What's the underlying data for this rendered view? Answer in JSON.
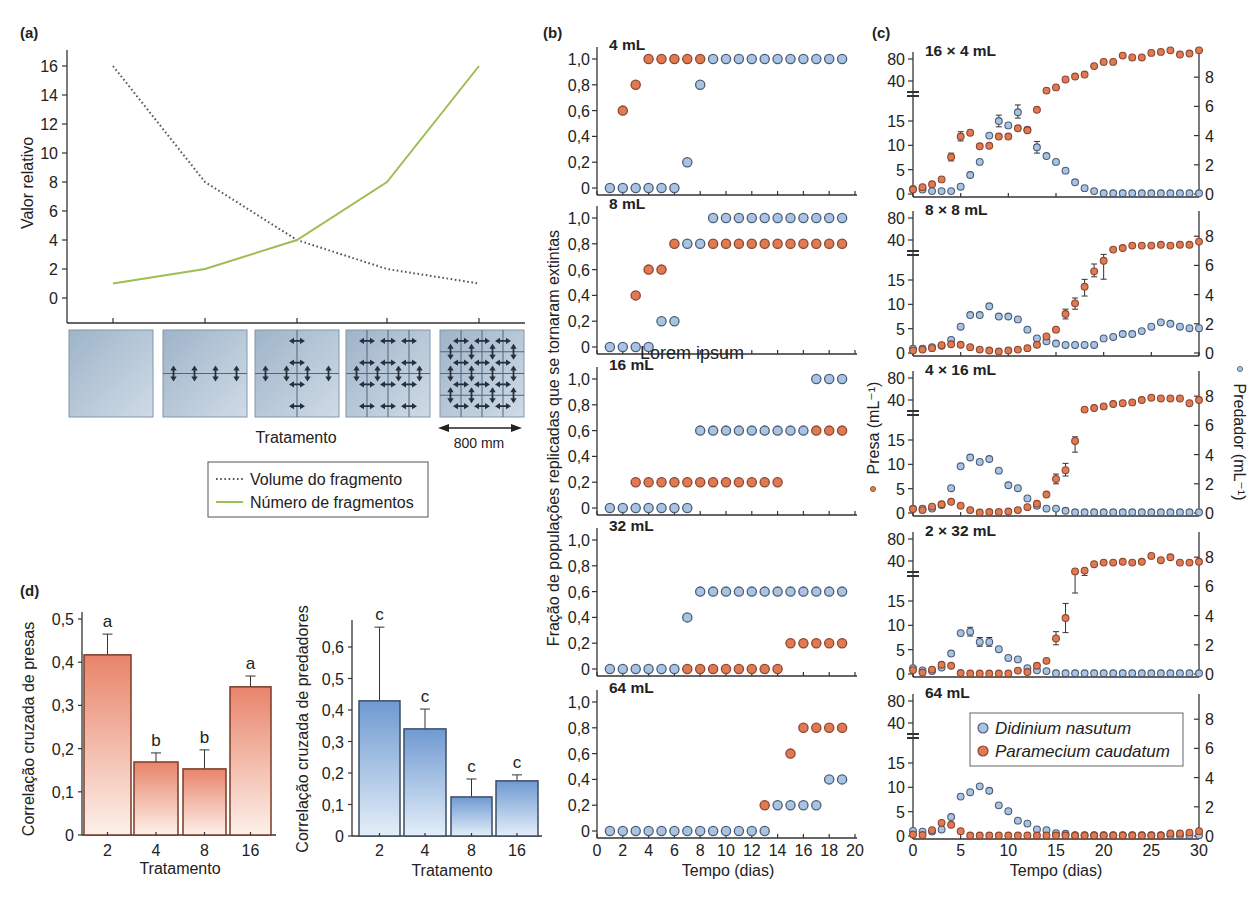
{
  "figure": {
    "overlay_text": "Lorem ipsum"
  },
  "colors": {
    "didinium": "#a9c3e3",
    "didinium_stroke": "#4b5d75",
    "paramecium": "#e07a52",
    "paramecium_stroke": "#8c4630",
    "volume_line": "#555555",
    "numero_line": "#9dbd55"
  },
  "chart_data": [
    {
      "id": "a",
      "type": "line",
      "panel_label": "(a)",
      "title": "",
      "xlabel": "Tratamento",
      "ylabel": "Valor relativo",
      "x": [
        1,
        2,
        3,
        4,
        5
      ],
      "ylim": [
        0,
        16
      ],
      "yticks": [
        0,
        2,
        4,
        6,
        8,
        10,
        12,
        14,
        16
      ],
      "grid": false,
      "series": [
        {
          "name": "Volume do fragmento",
          "style": "dotted",
          "color": "#555555",
          "values": [
            16,
            8,
            4,
            2,
            1
          ]
        },
        {
          "name": "Número de fragmentos",
          "style": "solid",
          "color": "#9dbd55",
          "values": [
            1,
            2,
            4,
            8,
            16
          ]
        }
      ],
      "legend_position": "below",
      "treatments": [
        {
          "fragments": 1,
          "cols": 1,
          "rows": 1
        },
        {
          "fragments": 2,
          "cols": 1,
          "rows": 2
        },
        {
          "fragments": 4,
          "cols": 2,
          "rows": 2
        },
        {
          "fragments": 8,
          "cols": 4,
          "rows": 2
        },
        {
          "fragments": 16,
          "cols": 4,
          "rows": 4
        }
      ],
      "scale_bar_label": "800 mm"
    },
    {
      "id": "b",
      "type": "scatter",
      "panel_label": "(b)",
      "xlabel": "Tempo (dias)",
      "ylabel": "Fração de populações replicadas que se tornaram extintas",
      "xlim": [
        0,
        20
      ],
      "xticks": [
        0,
        2,
        4,
        6,
        8,
        10,
        12,
        14,
        16,
        18,
        20
      ],
      "ylim": [
        0,
        1
      ],
      "yticks": [
        0,
        0.2,
        0.4,
        0.6,
        0.8,
        1.0
      ],
      "ytick_labels": [
        "0",
        "0,2",
        "0,4",
        "0,6",
        "0,8",
        "1,0"
      ],
      "days": [
        1,
        2,
        3,
        4,
        5,
        6,
        7,
        8,
        9,
        10,
        11,
        12,
        13,
        14,
        15,
        16,
        17,
        18,
        19
      ],
      "subplots": [
        {
          "title": "4 mL",
          "didinium": [
            0,
            0,
            0,
            0,
            0,
            0,
            0.2,
            0.8,
            1,
            1,
            1,
            1,
            1,
            1,
            1,
            1,
            1,
            1,
            1
          ],
          "paramecium": [
            null,
            0.6,
            0.8,
            1,
            1,
            1,
            1,
            1,
            null,
            null,
            null,
            null,
            null,
            null,
            null,
            null,
            null,
            null,
            null
          ]
        },
        {
          "title": "8 mL",
          "didinium": [
            0,
            0,
            0,
            0,
            0.2,
            0.2,
            0.8,
            0.8,
            1,
            1,
            1,
            1,
            1,
            1,
            1,
            1,
            1,
            1,
            1
          ],
          "paramecium": [
            null,
            null,
            0.4,
            0.6,
            0.6,
            0.8,
            null,
            null,
            0.8,
            0.8,
            0.8,
            0.8,
            0.8,
            0.8,
            0.8,
            0.8,
            0.8,
            0.8,
            0.8
          ]
        },
        {
          "title": "16 mL",
          "didinium": [
            0,
            0,
            0,
            0,
            0,
            0,
            0,
            0.6,
            0.6,
            0.6,
            0.6,
            0.6,
            0.6,
            0.6,
            0.6,
            0.6,
            1,
            1,
            1
          ],
          "paramecium": [
            null,
            null,
            0.2,
            0.2,
            0.2,
            0.2,
            0.2,
            0.2,
            0.2,
            0.2,
            0.2,
            0.2,
            0.2,
            0.2,
            null,
            null,
            0.6,
            0.6,
            0.6
          ]
        },
        {
          "title": "32 mL",
          "didinium": [
            0,
            0,
            0,
            0,
            0,
            0,
            0.4,
            0.6,
            0.6,
            0.6,
            0.6,
            0.6,
            0.6,
            0.6,
            0.6,
            0.6,
            0.6,
            0.6,
            0.6
          ],
          "paramecium": [
            null,
            null,
            null,
            null,
            null,
            null,
            0,
            0,
            0,
            0,
            0,
            0,
            0,
            0,
            0.2,
            0.2,
            0.2,
            0.2,
            0.2
          ]
        },
        {
          "title": "64 mL",
          "didinium": [
            0,
            0,
            0,
            0,
            0,
            0,
            0,
            0,
            0,
            0,
            0,
            0,
            0,
            0.2,
            0.2,
            0.2,
            0.2,
            0.4,
            0.4
          ],
          "paramecium": [
            null,
            null,
            null,
            null,
            null,
            null,
            null,
            null,
            null,
            null,
            null,
            null,
            0.2,
            null,
            0.6,
            0.8,
            0.8,
            0.8,
            0.8
          ]
        }
      ]
    },
    {
      "id": "c",
      "type": "scatter",
      "panel_label": "(c)",
      "xlabel": "Tempo (dias)",
      "ylabel_left": "Presa (mL⁻¹)",
      "ylabel_right": "Predador (mL⁻¹)",
      "xlim": [
        0,
        30
      ],
      "xticks": [
        0,
        5,
        10,
        15,
        20,
        25,
        30
      ],
      "yticks_left": [
        0,
        5,
        10,
        15,
        40,
        80
      ],
      "yticks_right": [
        0,
        2,
        4,
        6,
        8
      ],
      "left_axis_break": [
        15,
        40
      ],
      "legend": [
        {
          "name": "Didinium nasutum",
          "series": "didinium"
        },
        {
          "name": "Paramecium caudatum",
          "series": "paramecium"
        }
      ],
      "days": [
        0,
        1,
        2,
        3,
        4,
        5,
        6,
        7,
        8,
        9,
        10,
        11,
        12,
        13,
        14,
        15,
        16,
        17,
        18,
        19,
        20,
        21,
        22,
        23,
        24,
        25,
        26,
        27,
        28,
        29,
        30
      ],
      "subplots": [
        {
          "title": "16 × 4 mL",
          "paramecium": [
            0.9,
            1.4,
            2,
            3,
            7.6,
            11.8,
            12.6,
            9.8,
            9.9,
            11.8,
            11.8,
            13.5,
            13.1,
            22,
            34,
            36,
            42,
            46,
            49,
            64,
            73,
            73,
            89,
            84,
            84,
            97,
            100,
            105,
            92,
            95,
            105
          ],
          "didinium": [
            0.35,
            0.3,
            0.2,
            0.2,
            0.2,
            0.5,
            1.3,
            2.2,
            4.0,
            5.0,
            4.7,
            5.6,
            4.4,
            3.2,
            2.6,
            2.2,
            1.6,
            0.8,
            0.4,
            0.2,
            0.05,
            0.05,
            0.05,
            0.05,
            0.05,
            0.05,
            0.05,
            0.05,
            0.05,
            0.05,
            0.05
          ],
          "errors": [
            {
              "series": "paramecium",
              "day": 4,
              "lo": 6.8,
              "hi": 8.4
            },
            {
              "series": "paramecium",
              "day": 5,
              "lo": 10.9,
              "hi": 12.8
            },
            {
              "series": "didinium",
              "day": 9,
              "lo": 4.6,
              "hi": 5.4
            },
            {
              "series": "didinium",
              "day": 11,
              "lo": 5.2,
              "hi": 6.1
            },
            {
              "series": "didinium",
              "day": 13,
              "lo": 2.8,
              "hi": 3.6
            }
          ]
        },
        {
          "title": "8 × 8 mL",
          "paramecium": [
            0.5,
            0.7,
            1.0,
            1.6,
            1.8,
            1.7,
            1.2,
            0.7,
            0.5,
            0.3,
            0.5,
            0.7,
            1.0,
            1.7,
            3.4,
            4.8,
            8,
            10.2,
            13.6,
            20.4,
            27,
            34,
            35,
            36.5,
            36.5,
            36.5,
            37,
            36.5,
            37,
            37,
            39
          ],
          "didinium": [
            0.3,
            0.3,
            0.4,
            0.5,
            0.9,
            1.8,
            2.6,
            2.6,
            3.2,
            2.5,
            2.5,
            2.3,
            1.6,
            1.0,
            0.8,
            0.65,
            0.55,
            0.55,
            0.55,
            0.55,
            1.0,
            1.1,
            1.3,
            1.3,
            1.5,
            1.8,
            2.1,
            2.0,
            1.8,
            1.7,
            1.7
          ],
          "errors": [
            {
              "series": "paramecium",
              "day": 16,
              "lo": 7,
              "hi": 9
            },
            {
              "series": "paramecium",
              "day": 17,
              "lo": 9,
              "hi": 11.3
            },
            {
              "series": "paramecium",
              "day": 18,
              "lo": 11.7,
              "hi": 15.4
            },
            {
              "series": "paramecium",
              "day": 19,
              "lo": 17,
              "hi": 25
            },
            {
              "series": "paramecium",
              "day": 20,
              "lo": 15.5,
              "hi": 31
            }
          ]
        },
        {
          "title": "4 × 16 mL",
          "paramecium": [
            0.8,
            0.6,
            1.3,
            1.8,
            2.3,
            1.5,
            0.6,
            0.1,
            0.2,
            0.2,
            0.3,
            0.6,
            1.2,
            1.9,
            3.8,
            7.0,
            8.8,
            14.8,
            34,
            35,
            36,
            37.5,
            38,
            38.5,
            40,
            43,
            42,
            42,
            42,
            38,
            40
          ],
          "didinium": [
            0.3,
            0.3,
            0.3,
            0.55,
            1.7,
            3.2,
            3.8,
            3.5,
            3.7,
            2.9,
            1.9,
            1.7,
            1.0,
            0.5,
            0.3,
            0.3,
            0.15,
            0.05,
            0.05,
            0.05,
            0.05,
            0.05,
            0.05,
            0.05,
            0.05,
            0.05,
            0.05,
            0.05,
            0.05,
            0.05,
            0.05
          ],
          "errors": [
            {
              "series": "paramecium",
              "day": 15,
              "lo": 6,
              "hi": 8
            },
            {
              "series": "paramecium",
              "day": 16,
              "lo": 7.6,
              "hi": 10.2
            },
            {
              "series": "paramecium",
              "day": 17,
              "lo": 12.5,
              "hi": 17
            }
          ]
        },
        {
          "title": "2 × 32 mL",
          "paramecium": [
            0.8,
            0.3,
            0.9,
            1.9,
            1.7,
            0.2,
            0.1,
            0.1,
            0.1,
            0.1,
            0.1,
            0.7,
            0.4,
            1.7,
            2.7,
            7.3,
            11.5,
            33.5,
            34,
            38,
            39,
            39,
            39.5,
            39,
            39.5,
            47,
            41,
            45,
            39,
            39,
            39.5
          ],
          "didinium": [
            0.4,
            0.25,
            0.2,
            0.45,
            1.4,
            2.8,
            2.9,
            2.2,
            2.2,
            1.7,
            1.1,
            1.0,
            0.4,
            0.25,
            0.2,
            0.05,
            0.05,
            0.05,
            0.05,
            0.05,
            0.05,
            0.05,
            0.05,
            0.05,
            0.05,
            0.05,
            0.05,
            0.05,
            0.05,
            0.05,
            0.05
          ],
          "errors": [
            {
              "series": "paramecium",
              "day": 15,
              "lo": 6,
              "hi": 8.7
            },
            {
              "series": "paramecium",
              "day": 16,
              "lo": 8.5,
              "hi": 14.5
            },
            {
              "series": "paramecium",
              "day": 17,
              "lo": 20,
              "hi": 34
            },
            {
              "series": "paramecium",
              "day": 18,
              "lo": 31,
              "hi": 34.5
            },
            {
              "series": "didinium",
              "day": 6,
              "lo": 2.6,
              "hi": 3.2
            },
            {
              "series": "didinium",
              "day": 7,
              "lo": 1.9,
              "hi": 2.5
            },
            {
              "series": "didinium",
              "day": 8,
              "lo": 1.9,
              "hi": 2.5
            }
          ]
        },
        {
          "title": "64 mL",
          "paramecium": [
            0.3,
            0.2,
            1.2,
            2.7,
            2.3,
            1.0,
            0.1,
            0.1,
            0.1,
            0.1,
            0.1,
            0.1,
            0.1,
            0.1,
            0.1,
            0.1,
            0.1,
            0.1,
            0.1,
            0.1,
            0.1,
            0.1,
            0.1,
            0.1,
            0.1,
            0.1,
            0.1,
            0.5,
            0.5,
            0.7,
            1.0
          ],
          "didinium": [
            0.35,
            0.3,
            0.3,
            0.45,
            1.3,
            2.7,
            3.0,
            3.4,
            3.1,
            2.1,
            1.7,
            1.05,
            0.85,
            0.45,
            0.4,
            0.2,
            0.15,
            0.05,
            0.05,
            0.05,
            0.05,
            0.05,
            0.05,
            0.05,
            0.05,
            0.05,
            0.05,
            0.05,
            0.05,
            0.05,
            0.05
          ],
          "errors": []
        }
      ]
    },
    {
      "id": "d_prey",
      "type": "bar",
      "panel_label": "(d)",
      "xlabel": "Tratamento",
      "ylabel": "Correlação cruzada de presas",
      "categories": [
        "2",
        "4",
        "8",
        "16"
      ],
      "values": [
        0.417,
        0.169,
        0.153,
        0.343
      ],
      "error_upper": [
        0.465,
        0.19,
        0.197,
        0.368
      ],
      "letters": [
        "a",
        "b",
        "b",
        "a"
      ],
      "ylim": [
        0,
        0.5
      ],
      "yticks": [
        0,
        0.1,
        0.2,
        0.3,
        0.4,
        0.5
      ],
      "ytick_labels": [
        "0",
        "0,1",
        "0,2",
        "0,3",
        "0,4",
        "0,5"
      ]
    },
    {
      "id": "d_predator",
      "type": "bar",
      "xlabel": "Tratamento",
      "ylabel": "Correlação cruzada de predadores",
      "categories": [
        "2",
        "4",
        "8",
        "16"
      ],
      "values": [
        0.429,
        0.34,
        0.124,
        0.175
      ],
      "error_upper": [
        0.663,
        0.403,
        0.181,
        0.194
      ],
      "letters": [
        "c",
        "c",
        "c",
        "c"
      ],
      "ylim": [
        0,
        0.68
      ],
      "yticks": [
        0,
        0.1,
        0.2,
        0.3,
        0.4,
        0.5,
        0.6
      ],
      "ytick_labels": [
        "0",
        "0,1",
        "0,2",
        "0,3",
        "0,4",
        "0,5",
        "0,6"
      ]
    }
  ]
}
